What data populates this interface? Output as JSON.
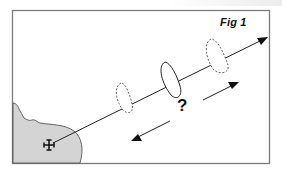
{
  "figure": {
    "label": "Fig 1",
    "question_mark": "?",
    "elements": {
      "land": "coastline-landmass",
      "port_symbol": "harbour-icon",
      "course_line": "course-arrow",
      "boats": [
        {
          "style": "dashed",
          "position": "past"
        },
        {
          "style": "solid",
          "position": "current"
        },
        {
          "style": "dashed",
          "position": "future"
        }
      ],
      "direction_arrows": [
        "forward",
        "backward"
      ]
    },
    "colors": {
      "land_fill": "#d4d4d4",
      "line": "#222222",
      "frame": "#7a7a7a"
    }
  }
}
